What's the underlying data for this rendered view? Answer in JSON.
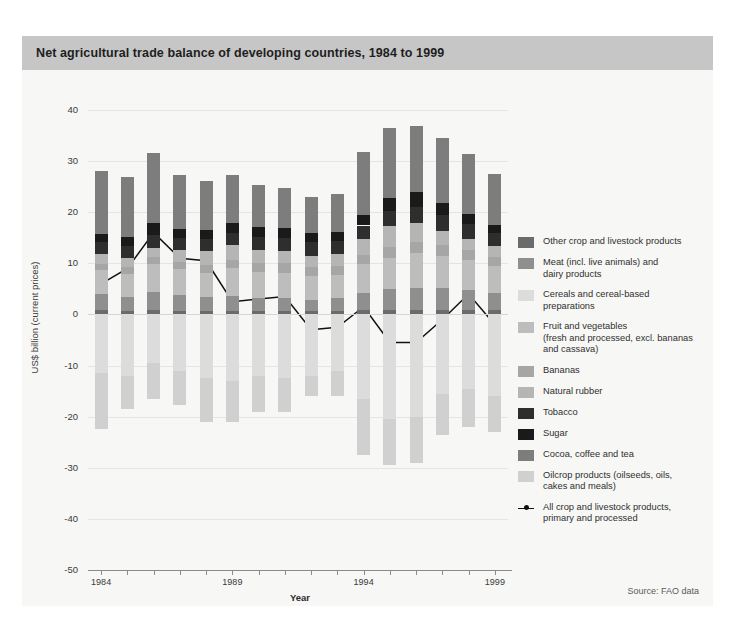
{
  "title": "Net agricultural trade balance of developing countries, 1984 to 1999",
  "source": "Source: FAO data",
  "chart_data": {
    "type": "bar",
    "title": "Net agricultural trade balance of developing countries, 1984 to 1999",
    "xlabel": "Year",
    "ylabel": "US$ billion (current prices)",
    "ylim": [
      -50,
      40
    ],
    "ytick_labels": [
      "40",
      "30",
      "20",
      "10",
      "0",
      "-10",
      "-20",
      "-30",
      "-40",
      "-50"
    ],
    "ytick_values": [
      40,
      30,
      20,
      10,
      0,
      -10,
      -20,
      -30,
      -40,
      -50
    ],
    "grid": true,
    "legend_position": "right",
    "stacked": true,
    "categories": [
      "1984",
      "1985",
      "1986",
      "1987",
      "1988",
      "1989",
      "1990",
      "1991",
      "1992",
      "1993",
      "1994",
      "1995",
      "1996",
      "1997",
      "1998",
      "1999"
    ],
    "xtick_labels_shown": [
      "1984",
      "1989",
      "1994",
      "1999"
    ],
    "series": [
      {
        "name": "Other crop and livestock products",
        "color": "#6b6b6b",
        "values": [
          0.8,
          0.6,
          0.9,
          0.7,
          0.6,
          0.7,
          0.6,
          0.7,
          0.6,
          0.7,
          0.8,
          0.9,
          0.8,
          0.9,
          0.9,
          0.8
        ]
      },
      {
        "name": "Meat (incl. live animals) and dairy products",
        "color": "#8f8f8f",
        "values": [
          3.2,
          2.9,
          3.4,
          3.1,
          2.8,
          3.0,
          2.7,
          2.5,
          2.3,
          2.6,
          3.4,
          4.0,
          4.4,
          4.2,
          3.8,
          3.4
        ]
      },
      {
        "name": "Cereals and cereal-based preparations",
        "color": "#dcdcdc",
        "values": [
          -11.5,
          -12.0,
          -9.5,
          -11.0,
          -12.5,
          -13.0,
          -12.0,
          -12.5,
          -12.0,
          -11.0,
          -16.5,
          -20.5,
          -20.0,
          -15.5,
          -14.5,
          -16.0
        ]
      },
      {
        "name": "Fruit and vegetables (fresh and processed, excl. bananas and cassava)",
        "color": "#bdbdbd",
        "values": [
          4.6,
          4.4,
          5.5,
          5.0,
          4.8,
          5.3,
          5.1,
          5.0,
          4.6,
          4.4,
          5.6,
          6.2,
          6.8,
          6.4,
          6.0,
          5.2
        ]
      },
      {
        "name": "Bananas",
        "color": "#a6a6a6",
        "values": [
          1.3,
          1.3,
          1.4,
          1.4,
          1.5,
          1.6,
          1.7,
          1.8,
          1.8,
          1.7,
          1.9,
          2.0,
          2.1,
          2.0,
          1.9,
          1.8
        ]
      },
      {
        "name": "Natural rubber",
        "color": "#b5b5b5",
        "values": [
          1.9,
          1.8,
          1.8,
          2.4,
          2.8,
          3.0,
          2.6,
          2.4,
          2.2,
          2.4,
          3.0,
          4.2,
          3.8,
          2.9,
          2.2,
          2.2
        ]
      },
      {
        "name": "Tobacco",
        "color": "#2e2e2e",
        "values": [
          2.4,
          2.4,
          2.6,
          2.3,
          2.3,
          2.4,
          2.4,
          2.5,
          2.6,
          2.5,
          2.7,
          2.9,
          3.1,
          3.0,
          2.8,
          2.5
        ]
      },
      {
        "name": "Sugar",
        "color": "#1a1a1a",
        "values": [
          1.6,
          1.7,
          2.2,
          1.9,
          1.7,
          1.9,
          2.0,
          2.1,
          1.9,
          1.8,
          2.1,
          2.6,
          2.9,
          2.4,
          2.0,
          1.6
        ]
      },
      {
        "name": "Cocoa, coffee and tea",
        "color": "#7d7d7d",
        "values": [
          12.2,
          11.8,
          13.8,
          10.5,
          9.6,
          9.4,
          8.2,
          7.7,
          7.0,
          7.5,
          12.3,
          13.6,
          13.0,
          12.8,
          11.8,
          10.0
        ]
      },
      {
        "name": "Oilcrop products (oilseeds, oils, cakes and meals)",
        "color": "#d0d0d0",
        "values": [
          -11.0,
          -6.5,
          -7.0,
          -6.8,
          -8.5,
          -8.0,
          -7.0,
          -6.5,
          -4.0,
          -5.0,
          -11.0,
          -9.0,
          -9.0,
          -8.0,
          -7.5,
          -7.0
        ]
      }
    ],
    "line_series": {
      "name": "All crop and livestock products, primary and processed",
      "color": "#111111",
      "values": [
        6.0,
        9.0,
        16.0,
        11.0,
        10.5,
        2.5,
        3.0,
        3.5,
        -3.0,
        -2.5,
        1.5,
        -5.5,
        -5.5,
        -1.0,
        4.0,
        -2.0
      ]
    },
    "positive_totals": [
      28.3,
      27.2,
      31.8,
      27.5,
      26.1,
      28.3,
      25.4,
      24.7,
      23.2,
      23.8,
      31.8,
      34.3,
      35.8,
      34.6,
      31.5,
      27.6
    ],
    "negative_totals": [
      -22.5,
      -18.5,
      -16.5,
      -17.8,
      -21.0,
      -21.0,
      -19.0,
      -19.0,
      -16.0,
      -16.0,
      -27.5,
      -29.5,
      -29.0,
      -23.5,
      -22.0,
      -23.0
    ]
  },
  "legend": {
    "items": [
      {
        "label": "Other crop and livestock products",
        "color": "#6b6b6b"
      },
      {
        "label": "Meat (incl. live animals) and\ndairy products",
        "color": "#8f8f8f"
      },
      {
        "label": "Cereals and cereal-based\npreparations",
        "color": "#dcdcdc"
      },
      {
        "label": "Fruit and vegetables\n(fresh and processed, excl. bananas\nand cassava)",
        "color": "#bdbdbd"
      },
      {
        "label": "Bananas",
        "color": "#a6a6a6"
      },
      {
        "label": "Natural rubber",
        "color": "#b5b5b5"
      },
      {
        "label": "Tobacco",
        "color": "#2e2e2e"
      },
      {
        "label": "Sugar",
        "color": "#1a1a1a"
      },
      {
        "label": "Cocoa, coffee and tea",
        "color": "#7d7d7d"
      },
      {
        "label": "Oilcrop products (oilseeds, oils,\ncakes and meals)",
        "color": "#d0d0d0"
      }
    ],
    "line_item": {
      "label": "All crop and livestock products,\nprimary and processed",
      "color": "#111111"
    }
  }
}
